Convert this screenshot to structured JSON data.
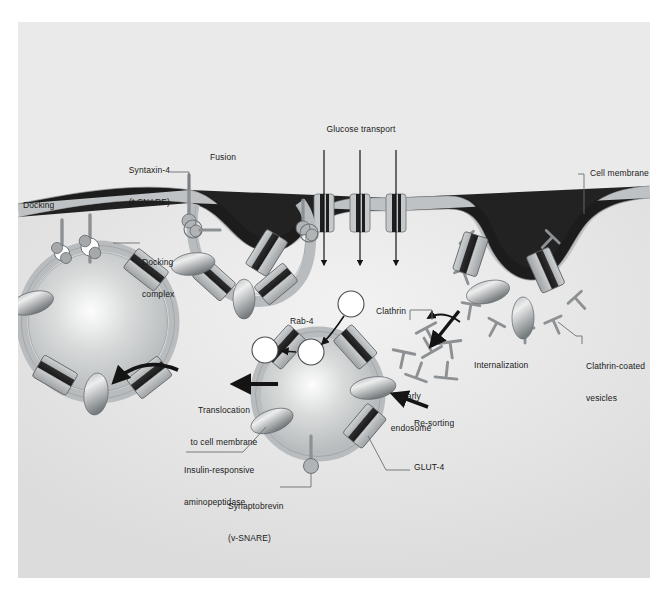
{
  "figure": {
    "domain": "biology-cell-diagram",
    "title_visible": "",
    "background_color": "#e9e9e9",
    "panel_border_color": "#d2d2d2",
    "ink_color": "#1a1a1a",
    "membrane_color": "#b9bcbe",
    "vesicle_fill": "#c3c6c8",
    "glut4_band_color": "#2a2a2a",
    "glut4_body_color": "#b0b4b6",
    "irap_color": "#8e9396",
    "white_vesicle_color": "#ffffff"
  },
  "labels": {
    "docking": "Docking",
    "docking_complex": "Docking\ncomplex",
    "syntaxin4": "Syntaxin-4\n(t-SNARE)",
    "fusion": "Fusion",
    "glucose_transport": "Glucose transport",
    "cell_membrane": "Cell membrane",
    "clathrin_coated_vesicles": "Clathrin-coated\nvesicles",
    "clathrin": "Clathrin",
    "internalization": "Internalization",
    "early_endosome": "Early\nendosome",
    "re_sorting": "Re-sorting",
    "rab4": "Rab-4",
    "translocation": "Translocation\nto cell membrane",
    "insulin_responsive_aminopeptidase": "Insulin-responsive\naminopeptidase",
    "synaptobrevin": "Synaptobrevin\n(v-SNARE)",
    "glut4": "GLUT-4"
  },
  "label_lines": {
    "docking": [
      "Docking"
    ],
    "docking_complex": [
      "Docking",
      "complex"
    ],
    "syntaxin4": [
      "Syntaxin-4",
      "(t-SNARE)"
    ],
    "fusion": [
      "Fusion"
    ],
    "glucose_transport": [
      "Glucose transport"
    ],
    "cell_membrane": [
      "Cell membrane"
    ],
    "clathrin_coated_vesicles": [
      "Clathrin-coated",
      "vesicles"
    ],
    "clathrin": [
      "Clathrin"
    ],
    "internalization": [
      "Internalization"
    ],
    "early_endosome": [
      "Early",
      "endosome"
    ],
    "re_sorting": [
      "Re-sorting"
    ],
    "rab4": [
      "Rab-4"
    ],
    "translocation": [
      "Translocation",
      "to cell membrane"
    ],
    "insulin_responsive_aminopeptidase": [
      "Insulin-responsive",
      "aminopeptidase"
    ],
    "synaptobrevin": [
      "Synaptobrevin",
      "(v-SNARE)"
    ],
    "glut4": [
      "GLUT-4"
    ]
  },
  "processes": {
    "arrows": [
      {
        "name": "glucose-transport-arrow-1",
        "direction": "down"
      },
      {
        "name": "glucose-transport-arrow-2",
        "direction": "down"
      },
      {
        "name": "glucose-transport-arrow-3",
        "direction": "down"
      },
      {
        "name": "internalization-arrow",
        "direction": "down-left"
      },
      {
        "name": "clathrin-uncoating-arrow",
        "direction": "left"
      },
      {
        "name": "re-sorting-arrow",
        "direction": "left"
      },
      {
        "name": "rab4-arrow-1",
        "direction": "down-left"
      },
      {
        "name": "rab4-arrow-2",
        "direction": "left"
      },
      {
        "name": "translocation-arrow",
        "direction": "left"
      },
      {
        "name": "translocation-arrow-docking",
        "direction": "up-left"
      }
    ]
  },
  "components": {
    "glut4_transporters_count": 14,
    "clathrin_triskelions_count": 7,
    "white_vesicles_count": 3,
    "docking_complexes_count": 2,
    "membrane_transporters_count": 3
  }
}
